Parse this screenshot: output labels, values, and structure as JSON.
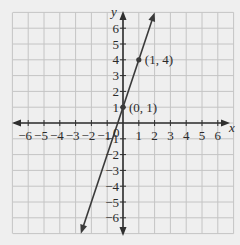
{
  "chart_data": {
    "type": "line",
    "title": "",
    "xlabel": "x",
    "ylabel": "y",
    "xlim": [
      -6,
      6
    ],
    "ylim": [
      -6,
      6
    ],
    "grid": true,
    "x_ticks": [
      -6,
      -5,
      -4,
      -3,
      -2,
      -1,
      1,
      2,
      3,
      4,
      5,
      6
    ],
    "y_ticks": [
      -6,
      -5,
      -4,
      -3,
      -2,
      -1,
      1,
      2,
      3,
      4,
      5,
      6
    ],
    "x_tick_labels": [
      "−6",
      "−5",
      "−4",
      "−3",
      "−2",
      "−1",
      "1",
      "2",
      "3",
      "4",
      "5",
      "6"
    ],
    "y_tick_labels": [
      "−6",
      "−5",
      "−4",
      "−3",
      "−2",
      "−1",
      "1",
      "2",
      "3",
      "4",
      "5",
      "6"
    ],
    "origin_label": "0",
    "series": [
      {
        "name": "y = 3x + 1",
        "slope": 3,
        "intercept": 1,
        "x_range": [
          -2.67,
          2
        ],
        "arrows": "both"
      }
    ],
    "points": [
      {
        "x": 0,
        "y": 1,
        "label": "(0, 1)"
      },
      {
        "x": 1,
        "y": 4,
        "label": "(1, 4)"
      }
    ],
    "colors": {
      "background": "#efefef",
      "grid": "#c4c4c4",
      "axis": "#2f2f2f",
      "line": "#3a3a3a"
    }
  }
}
